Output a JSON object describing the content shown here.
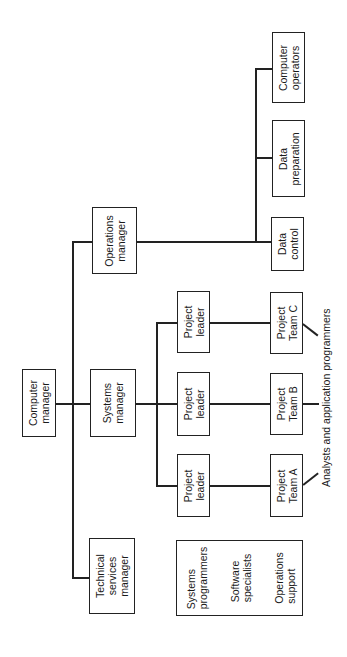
{
  "chart": {
    "orientation": "rotated-90-ccw",
    "nodes": {
      "computer_manager": [
        "Computer",
        "manager"
      ],
      "operations_manager": [
        "Operations",
        "manager"
      ],
      "systems_manager": [
        "Systems",
        "manager"
      ],
      "technical_services_manager": [
        "Technical",
        "services",
        "manager"
      ],
      "data_control": [
        "Data",
        "control"
      ],
      "data_preparation": [
        "Data",
        "preparation"
      ],
      "computer_operators": [
        "Computer",
        "operators"
      ],
      "project_leader_c": [
        "Project",
        "leader"
      ],
      "project_leader_b": [
        "Project",
        "leader"
      ],
      "project_leader_a": [
        "Project",
        "leader"
      ],
      "project_team_c": [
        "Project",
        "Team C"
      ],
      "project_team_b": [
        "Project",
        "Team B"
      ],
      "project_team_a": [
        "Project",
        "Team A"
      ],
      "support_groups": [
        [
          "Systems",
          "programmers"
        ],
        [
          "Software",
          "specialists"
        ],
        [
          "Operations",
          "support"
        ]
      ]
    },
    "annotation": "Analysts and application programmers"
  }
}
